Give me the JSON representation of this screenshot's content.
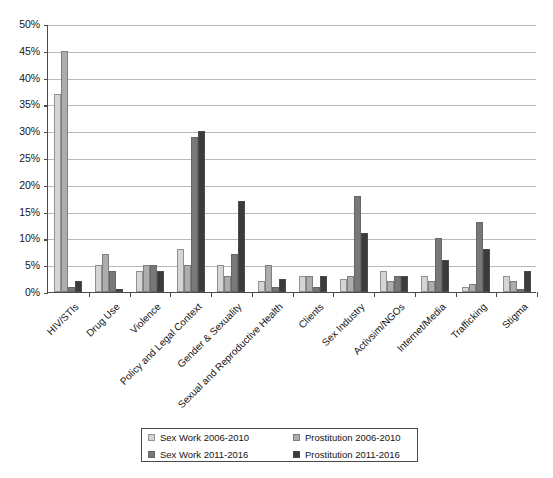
{
  "chart_data": {
    "type": "bar",
    "title": "",
    "xlabel": "",
    "ylabel": "",
    "ylim": [
      0,
      50
    ],
    "y_tick_labels": [
      "0%",
      "5%",
      "10%",
      "15%",
      "20%",
      "25%",
      "30%",
      "35%",
      "40%",
      "45%",
      "50%"
    ],
    "y_tick_values": [
      0,
      5,
      10,
      15,
      20,
      25,
      30,
      35,
      40,
      45,
      50
    ],
    "grid": true,
    "legend_position": "bottom",
    "categories": [
      "HIV/STIs",
      "Drug Use",
      "Violence",
      "Policy and Legal Context",
      "Gender & Sexuality",
      "Sexual and Reproductive Health",
      "Clients",
      "Sex Industry",
      "Activsim/NGOs",
      "Internet/Media",
      "Trafficking",
      "Stigma"
    ],
    "series": [
      {
        "name": "Sex Work 2006-2010",
        "color": "#d5d5d5",
        "values": [
          37,
          5,
          4,
          8,
          5,
          2,
          3,
          2.5,
          4,
          3,
          1,
          3
        ]
      },
      {
        "name": "Prostitution 2006-2010",
        "color": "#adadad",
        "values": [
          45,
          7,
          5,
          5,
          3,
          5,
          3,
          3,
          2,
          2,
          1.5,
          2
        ]
      },
      {
        "name": "Sex Work 2011-2016",
        "color": "#787878",
        "values": [
          1,
          4,
          5,
          29,
          7,
          1,
          1,
          18,
          3,
          10,
          13,
          0.5
        ]
      },
      {
        "name": "Prostitution 2011-2016",
        "color": "#3b3b3b",
        "values": [
          2,
          0.5,
          4,
          30,
          17,
          2.5,
          3,
          11,
          3,
          6,
          8,
          4
        ]
      }
    ]
  },
  "legend": {
    "entries": [
      "Sex Work 2006-2010",
      "Prostitution 2006-2010",
      "Sex Work 2011-2016",
      "Prostitution 2011-2016"
    ]
  }
}
